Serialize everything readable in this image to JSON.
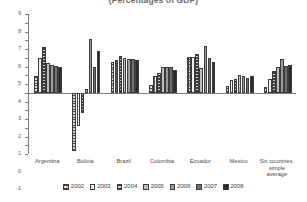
{
  "chart_data": {
    "type": "bar",
    "title": "(Percentages of GDP)",
    "xlabel": "",
    "ylabel": "",
    "ylim": [
      -7,
      9
    ],
    "ytick_step": 1,
    "yticks": [
      "9",
      "8",
      "7",
      "6",
      "5",
      "4",
      "3",
      "2",
      "1",
      "0",
      "-1",
      "-2",
      "-3",
      "-4",
      "-5",
      "-6",
      "-7"
    ],
    "grid": false,
    "legend_position": "bottom",
    "categories": [
      "Argentina",
      "Bolivia",
      "Brazil",
      "Colombia",
      "Ecuador",
      "Mexico",
      "Six countries,\nsimple average"
    ],
    "categories_display": [
      [
        "Argentina"
      ],
      [
        "Bolivia"
      ],
      [
        "Brazil"
      ],
      [
        "Colombia"
      ],
      [
        "Ecuador"
      ],
      [
        "Mexico"
      ],
      [
        "Six countries,",
        "simple average"
      ]
    ],
    "series": [
      {
        "name": "2002",
        "color": "#d8d8d8",
        "values": [
          1.9,
          -6.7,
          3.5,
          0.9,
          4.1,
          0.8,
          0.7
        ]
      },
      {
        "name": "2003",
        "color": "#f2f2f2",
        "values": [
          4.0,
          -3.8,
          3.7,
          1.9,
          4.1,
          1.5,
          1.6
        ]
      },
      {
        "name": "2004",
        "color": "#cfcfcf",
        "values": [
          5.2,
          -2.3,
          4.2,
          2.3,
          4.4,
          1.6,
          2.5
        ]
      },
      {
        "name": "2005",
        "color": "#bdbdbd",
        "values": [
          3.4,
          0.4,
          4.0,
          3.0,
          2.8,
          2.0,
          2.9
        ]
      },
      {
        "name": "2006",
        "color": "#9a9a9a",
        "values": [
          3.2,
          6.2,
          3.9,
          3.0,
          5.3,
          1.9,
          3.9
        ]
      },
      {
        "name": "2007",
        "color": "#6f6f6f",
        "values": [
          3.1,
          3.0,
          3.9,
          2.9,
          4.0,
          1.7,
          3.1
        ]
      },
      {
        "name": "2008",
        "color": "#2b2b2b",
        "values": [
          3.0,
          4.8,
          3.7,
          2.6,
          3.5,
          1.9,
          3.2
        ]
      }
    ]
  },
  "legend": {
    "items": [
      {
        "label": "2002"
      },
      {
        "label": "2003"
      },
      {
        "label": "2004"
      },
      {
        "label": "2005"
      },
      {
        "label": "2006"
      },
      {
        "label": "2007"
      },
      {
        "label": "2008"
      }
    ]
  }
}
